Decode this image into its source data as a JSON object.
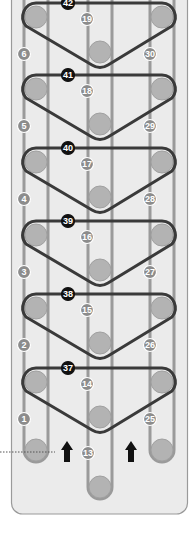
{
  "diagram": {
    "type": "belt-threading-diagram",
    "colors": {
      "panel_fill": "#ebebeb",
      "panel_stroke": "#9a9a9a",
      "rail": "#9a9a9a",
      "roller_fill": "#b3b3b3",
      "roller_stroke": "#999999",
      "belt": "#3a3a3a",
      "belt_label_fill": "#111111",
      "path_label_fill": "#8c8c8c",
      "arrow": "#111111",
      "leader": "#555555"
    },
    "belt_rows": [
      {
        "belt_label": "42",
        "center_label": "19",
        "left_label": "6",
        "right_label": "30"
      },
      {
        "belt_label": "41",
        "center_label": "18",
        "left_label": "5",
        "right_label": "29"
      },
      {
        "belt_label": "40",
        "center_label": "17",
        "left_label": "4",
        "right_label": "28"
      },
      {
        "belt_label": "39",
        "center_label": "16",
        "left_label": "3",
        "right_label": "27"
      },
      {
        "belt_label": "38",
        "center_label": "15",
        "left_label": "2",
        "right_label": "26"
      },
      {
        "belt_label": "37",
        "center_label": "14",
        "left_label": "1",
        "right_label": "25"
      }
    ],
    "bottom": {
      "center_label": "13",
      "arrows": [
        "up-arrow",
        "up-arrow"
      ],
      "leader_line": "dotted"
    }
  }
}
